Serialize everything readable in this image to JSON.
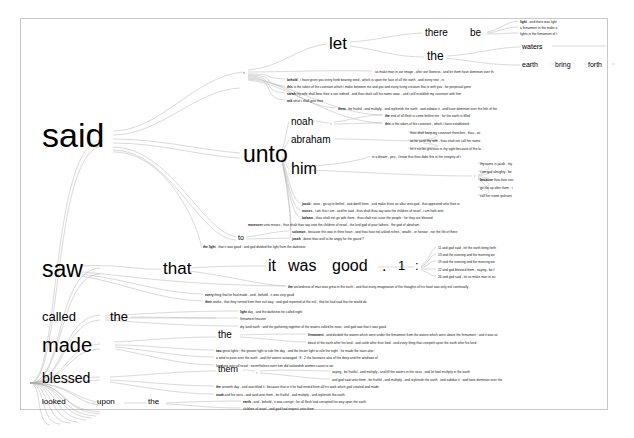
{
  "app": {
    "type": "word-tree-visualization",
    "root_word": "god",
    "corpus": "Genesis (King James Bible)",
    "background_color": "#ffffff",
    "frame_color": "#c9c9c9",
    "text_color": "#000000",
    "branch_color": "#9a9a9a"
  },
  "chart_data": {
    "type": "tree",
    "title": "",
    "root": "god",
    "branches": [
      {
        "label": "said",
        "size": 34,
        "count": 0
      },
      {
        "label": "saw",
        "size": 23,
        "count": 0
      },
      {
        "label": "called",
        "size": 13,
        "count": 0
      },
      {
        "label": "made",
        "size": 20,
        "count": 0
      },
      {
        "label": "blessed",
        "size": 13,
        "count": 0
      },
      {
        "label": "looked",
        "size": 8,
        "count": 0
      }
    ]
  },
  "nodes": {
    "said": {
      "text": "said",
      "x": 42,
      "y": 135,
      "size": 34
    },
    "comma1": {
      "text": ",",
      "x": 243,
      "y": 73,
      "size": 7
    },
    "let": {
      "text": "let",
      "x": 329,
      "y": 44,
      "size": 17
    },
    "there": {
      "text": "there",
      "x": 425,
      "y": 33,
      "size": 10
    },
    "be": {
      "text": "be",
      "x": 470,
      "y": 33,
      "size": 10
    },
    "the_a": {
      "text": "the",
      "x": 427,
      "y": 57,
      "size": 12
    },
    "waters": {
      "text": "waters",
      "x": 522,
      "y": 47,
      "size": 7
    },
    "earth": {
      "text": "earth",
      "x": 522,
      "y": 65,
      "size": 7
    },
    "bring": {
      "text": "bring",
      "x": 555,
      "y": 65,
      "size": 7
    },
    "forth": {
      "text": "forth",
      "x": 588,
      "y": 65,
      "size": 7
    },
    "unto": {
      "text": "unto",
      "x": 243,
      "y": 155,
      "size": 23
    },
    "noah": {
      "text": "noah",
      "x": 291,
      "y": 122,
      "size": 10
    },
    "comma2": {
      "text": ",",
      "x": 330,
      "y": 124,
      "size": 5
    },
    "abraham": {
      "text": "abraham",
      "x": 291,
      "y": 140,
      "size": 10
    },
    "comma3": {
      "text": ",",
      "x": 419,
      "y": 142,
      "size": 5
    },
    "him": {
      "text": "him",
      "x": 291,
      "y": 170,
      "size": 16
    },
    "comma4": {
      "text": ",",
      "x": 474,
      "y": 176,
      "size": 5
    },
    "to": {
      "text": "to",
      "x": 238,
      "y": 238,
      "size": 7
    },
    "saw": {
      "text": "saw",
      "x": 42,
      "y": 271,
      "size": 23
    },
    "that": {
      "text": "that",
      "x": 163,
      "y": 270,
      "size": 17
    },
    "it": {
      "text": "it",
      "x": 268,
      "y": 268,
      "size": 16
    },
    "was": {
      "text": "was",
      "x": 290,
      "y": 268,
      "size": 16
    },
    "good": {
      "text": "good",
      "x": 334,
      "y": 268,
      "size": 16
    },
    "period": {
      "text": ".",
      "x": 382,
      "y": 268,
      "size": 16
    },
    "one": {
      "text": "1",
      "x": 398,
      "y": 268,
      "size": 13
    },
    "colon": {
      "text": ":",
      "x": 415,
      "y": 268,
      "size": 13
    },
    "called": {
      "text": "called",
      "x": 42,
      "y": 318,
      "size": 13
    },
    "the_b": {
      "text": "the",
      "x": 110,
      "y": 318,
      "size": 13
    },
    "the_c": {
      "text": "the",
      "x": 218,
      "y": 337,
      "size": 10
    },
    "made": {
      "text": "made",
      "x": 42,
      "y": 345,
      "size": 20
    },
    "blessed": {
      "text": "blessed",
      "x": 42,
      "y": 380,
      "size": 14
    },
    "them": {
      "text": "them",
      "x": 218,
      "y": 371,
      "size": 9
    },
    "comma5": {
      "text": ",",
      "x": 256,
      "y": 373,
      "size": 5
    },
    "looked": {
      "text": "looked",
      "x": 42,
      "y": 404,
      "size": 8
    },
    "upon": {
      "text": "upon",
      "x": 97,
      "y": 404,
      "size": 8
    },
    "the_d": {
      "text": "the",
      "x": 148,
      "y": 404,
      "size": 8
    }
  },
  "leaves": [
    {
      "id": "l1",
      "x": 520,
      "y": 21,
      "bold": "light",
      "rest": " . and there was light"
    },
    {
      "id": "l2",
      "x": 520,
      "y": 27,
      "bold": "",
      "rest": "a firmament in the midst o"
    },
    {
      "id": "l3",
      "x": 520,
      "y": 33,
      "bold": "",
      "rest": "lights in the firmament of t"
    },
    {
      "id": "l4",
      "x": 375,
      "y": 71,
      "bold": "",
      "rest": "us make man in our image , after our likeness . and let them have dominion over th"
    },
    {
      "id": "l5",
      "x": 287,
      "y": 79,
      "bold": "behold",
      "rest": " , i have given you every herb bearing seed , which is upon the face of all the earth . and every tree , in"
    },
    {
      "id": "l6",
      "x": 287,
      "y": 86,
      "bold": "this",
      "rest": " is the token of the covenant which i make between me and you and every living creature that is with you , for perpetual gene"
    },
    {
      "id": "l7",
      "x": 287,
      "y": 93,
      "bold": "sarah",
      "rest": " thy wife shall bear thee a son indeed . and thou shalt call his name isaac . and i will establish my covenant with him"
    },
    {
      "id": "l8",
      "x": 287,
      "y": 100,
      "bold": "ask",
      "rest": " what i shall give thee"
    },
    {
      "id": "l9",
      "x": 338,
      "y": 108,
      "bold": "them",
      "rest": " , be fruitful , and multiply , and replenish the earth . and subdue it . and have dominion over the fish of the"
    },
    {
      "id": "l10",
      "x": 385,
      "y": 115,
      "bold": "the",
      "rest": " end of all flesh is come before me . for the earth is filled"
    },
    {
      "id": "l11",
      "x": 385,
      "y": 123,
      "bold": "this",
      "rest": " is the token of the covenant , which i have established"
    },
    {
      "id": "l12",
      "x": 410,
      "y": 132,
      "bold": "",
      "rest": "thou shalt keep my covenant therefore , thou , an"
    },
    {
      "id": "l13",
      "x": 410,
      "y": 140,
      "bold": "",
      "rest": "as for sarai thy wife , thou shalt not call her name"
    },
    {
      "id": "l14",
      "x": 410,
      "y": 148,
      "bold": "",
      "rest": "let it not be grievous in thy sight because of the la"
    },
    {
      "id": "l15",
      "x": 372,
      "y": 156,
      "bold": "",
      "rest": "in a dream , yea , i know that thou didst this in the integrity of t"
    },
    {
      "id": "l16",
      "x": 480,
      "y": 163,
      "bold": "",
      "rest": "thy name is jacob . thy"
    },
    {
      "id": "l17",
      "x": 480,
      "y": 171,
      "bold": "",
      "rest": "i am god almighty : be"
    },
    {
      "id": "l18",
      "x": 480,
      "y": 179,
      "bold": "because",
      "rest": " thou hast sou"
    },
    {
      "id": "l19",
      "x": 480,
      "y": 187,
      "bold": "",
      "rest": "go not up after them . t"
    },
    {
      "id": "l20",
      "x": 480,
      "y": 195,
      "bold": "",
      "rest": "call her name ipuharni"
    },
    {
      "id": "l21",
      "x": 302,
      "y": 203,
      "bold": "jacob",
      "rest": " , arise , go up to bethel , and dwell there . and make there an altar unto god , that appeared unto thee w"
    },
    {
      "id": "l22",
      "x": 302,
      "y": 210,
      "bold": "moses",
      "rest": " , i am that i am . and he said , thus shalt thou say unto the children of israel , i am hath sent"
    },
    {
      "id": "l23",
      "x": 302,
      "y": 217,
      "bold": "balaam",
      "rest": " , thou shalt not go with them . thou shalt not curse the people : for they are blessed"
    },
    {
      "id": "l24",
      "x": 248,
      "y": 224,
      "bold": "moreover",
      "rest": " unto moses , thus shalt thou say unto the children of israel , the lord god of your fathers , the god of abraham ,"
    },
    {
      "id": "l25",
      "x": 292,
      "y": 231,
      "bold": "solomon",
      "rest": " , because this was in thine heart , and thou hast not asked riches , wealth , or honour , nor the life of thine"
    },
    {
      "id": "l26",
      "x": 292,
      "y": 238,
      "bold": "jonah",
      "rest": " , doest thou well to be angry for the gourd ?"
    },
    {
      "id": "l27",
      "x": 203,
      "y": 246,
      "bold": "the light",
      "rest": " , that it was good : and god divided the light from the darkness"
    },
    {
      "id": "l28",
      "x": 438,
      "y": 247,
      "bold": "",
      "rest": "11 and god said , let the earth bring forth"
    },
    {
      "id": "l29",
      "x": 438,
      "y": 254,
      "bold": "",
      "rest": "13 and the evening and the morning we"
    },
    {
      "id": "l30",
      "x": 438,
      "y": 261,
      "bold": "",
      "rest": "19 and the evening and the morning we"
    },
    {
      "id": "l31",
      "x": 438,
      "y": 269,
      "bold": "",
      "rest": "22 and god blessed them , saying , be f"
    },
    {
      "id": "l32",
      "x": 438,
      "y": 276,
      "bold": "",
      "rest": "26 and god said , let us make man in ou"
    },
    {
      "id": "l33",
      "x": 288,
      "y": 286,
      "bold": "the",
      "rest": " wickedness of man was great in the earth , and that every imagination of the thoughts of his heart was only evil continually"
    },
    {
      "id": "l34",
      "x": 205,
      "y": 294,
      "bold": "every",
      "rest": " thing that he had made , and , behold , it was very good"
    },
    {
      "id": "l35",
      "x": 205,
      "y": 301,
      "bold": "their",
      "rest": " works , that they turned from their evil way ; and god repented of the evil , that he had said that he would do"
    },
    {
      "id": "l36",
      "x": 240,
      "y": 311,
      "bold": "light",
      "rest": " day , and the darkness he called night"
    },
    {
      "id": "l37",
      "x": 240,
      "y": 318,
      "bold": "",
      "rest": "firmament heaven"
    },
    {
      "id": "l38",
      "x": 240,
      "y": 326,
      "bold": "",
      "rest": "dry land earth ; and the gathering together of the waters called he seas : and god saw that it was good"
    },
    {
      "id": "l39",
      "x": 308,
      "y": 334,
      "bold": "firmament",
      "rest": " , and divided the waters which were under the firmament from the waters which were above the firmament : and it was so"
    },
    {
      "id": "l40",
      "x": 308,
      "y": 342,
      "bold": "",
      "rest": "beast of the earth after his kind , and cattle after their kind , and every thing that creepeth upon the earth after his kind :"
    },
    {
      "id": "l41",
      "x": 216,
      "y": 350,
      "bold": "two",
      "rest": " great lights ; the greater light to rule the day , and the lesser light to rule the night : he made the stars also :"
    },
    {
      "id": "l42",
      "x": 216,
      "y": 357,
      "bold": "",
      "rest": "a wind to pass over the earth , and the waters asswaged ; 8 : 2 the fountains also of the deep and the windows of"
    },
    {
      "id": "l43",
      "x": 216,
      "y": 365,
      "bold": "",
      "rest": "him king over all israel : nevertheless even him did outlandish women cause to sin"
    },
    {
      "id": "l44",
      "x": 332,
      "y": 371,
      "bold": "",
      "rest": "saying , be fruitful , and multiply , and fill the waters in the seas , and let fowl multiply in the earth"
    },
    {
      "id": "l45",
      "x": 332,
      "y": 379,
      "bold": "",
      "rest": "and god said unto them , be fruitful , and multiply , and replenish the earth , and subdue it : and have dominion over the"
    },
    {
      "id": "l46",
      "x": 216,
      "y": 386,
      "bold": "the",
      "rest": " seventh day , and sanctified it : because that in it he had rested from all his work which god created and made"
    },
    {
      "id": "l47",
      "x": 216,
      "y": 394,
      "bold": "noah",
      "rest": " and his sons , and said unto them , be fruitful , and multiply , and replenish the earth"
    },
    {
      "id": "l48",
      "x": 243,
      "y": 401,
      "bold": "earth",
      "rest": " , and , behold , it was corrupt ; for all flesh had corrupted his way upon the earth"
    },
    {
      "id": "l49",
      "x": 243,
      "y": 408,
      "bold": "",
      "rest": "children of israel , and god had respect unto them"
    }
  ]
}
